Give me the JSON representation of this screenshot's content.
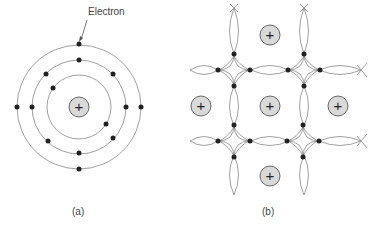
{
  "figure": {
    "panel_a": {
      "caption": "(a)",
      "annotation": "Electron",
      "nucleus_symbol": "+",
      "nucleus": {
        "cx": 79,
        "cy": 107,
        "r": 10
      },
      "orbits": [
        32,
        47,
        62
      ],
      "electrons": [
        [
          53,
          88
        ],
        [
          106,
          124
        ],
        [
          79,
          60
        ],
        [
          46,
          74
        ],
        [
          113,
          74
        ],
        [
          32,
          107
        ],
        [
          126,
          107
        ],
        [
          48,
          141
        ],
        [
          113,
          138
        ],
        [
          79,
          153
        ],
        [
          79,
          44
        ],
        [
          17,
          107
        ],
        [
          141,
          107
        ],
        [
          79,
          169
        ]
      ]
    },
    "panel_b": {
      "caption": "(b)",
      "ion_symbol": "+",
      "ions": [
        [
          270,
          35
        ],
        [
          201,
          106
        ],
        [
          270,
          106
        ],
        [
          338,
          106
        ],
        [
          270,
          176
        ]
      ],
      "diamonds": [
        {
          "cx": 234,
          "cy": 70
        },
        {
          "cx": 304,
          "cy": 70
        },
        {
          "cx": 234,
          "cy": 141
        },
        {
          "cx": 303,
          "cy": 141
        }
      ]
    },
    "colors": {
      "line": "#888888",
      "electron": "#222222",
      "ion_fill": "#d9d9d9",
      "ion_stroke": "#666666",
      "text": "#444444"
    }
  }
}
